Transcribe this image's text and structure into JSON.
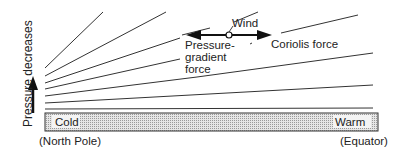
{
  "diagram": {
    "axis_label": "Pressure decreases",
    "wind_label": "Wind",
    "pgf_label_lines": [
      "Pressure-",
      "gradient",
      "force"
    ],
    "coriolis_label": "Coriolis force",
    "surface": {
      "left_label": "Cold",
      "right_label": "Warm"
    },
    "left_location": "(North Pole)",
    "right_location": "(Equator)"
  }
}
